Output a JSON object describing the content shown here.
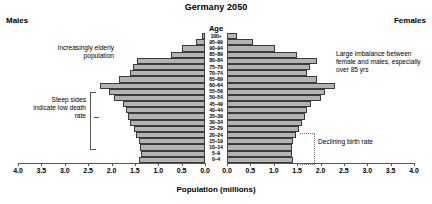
{
  "title": "Germany 2050",
  "side_labels": {
    "males": "Males",
    "females": "Females"
  },
  "age_axis_title": "Age",
  "x_axis_title": "Population (millions)",
  "annotations": {
    "elderly": "Increasingly elderly population",
    "steep": "Steep sides indicate low death rate",
    "imbalance": "Large imbalance between female and males, especially over 85 yrs",
    "birth": "Declining birth rate"
  },
  "colors": {
    "bar_fill": "#b3b3b3",
    "bar_stroke": "#3b3b3b",
    "axis": "#555555",
    "text": "#000000",
    "background": "#ffffff"
  },
  "chart_data": {
    "type": "bar",
    "subtype": "population-pyramid",
    "title": "Germany 2050",
    "xlabel": "Population (millions)",
    "ylabel": "Age",
    "xlim": [
      0,
      4.0
    ],
    "xticks": [
      4.0,
      3.5,
      3.0,
      2.5,
      2.0,
      1.5,
      1.0,
      0.5,
      0.0
    ],
    "xtick_labels": [
      "4.0",
      "3.5",
      "3.0",
      "2.5",
      "2.0",
      "1.5",
      "1.0",
      "0.5",
      "0.0"
    ],
    "grid": false,
    "legend": null,
    "categories": [
      "100+",
      "95-99",
      "90-94",
      "85-89",
      "80-84",
      "75-79",
      "70-74",
      "65-69",
      "60-64",
      "55-59",
      "50-54",
      "45-49",
      "40-44",
      "35-39",
      "30-34",
      "25-29",
      "20-24",
      "15-19",
      "10-14",
      "5-9",
      "0-4"
    ],
    "series": [
      {
        "name": "Males",
        "side": "left",
        "values": [
          0.07,
          0.2,
          0.5,
          0.72,
          1.45,
          1.55,
          1.6,
          1.85,
          2.25,
          2.05,
          1.95,
          1.75,
          1.7,
          1.65,
          1.6,
          1.52,
          1.48,
          1.42,
          1.4,
          1.38,
          1.42
        ]
      },
      {
        "name": "Females",
        "side": "right",
        "values": [
          0.22,
          0.55,
          1.02,
          1.5,
          1.92,
          1.78,
          1.72,
          1.92,
          2.3,
          2.1,
          2.0,
          1.8,
          1.72,
          1.66,
          1.6,
          1.54,
          1.48,
          1.42,
          1.4,
          1.38,
          1.42
        ]
      }
    ]
  }
}
